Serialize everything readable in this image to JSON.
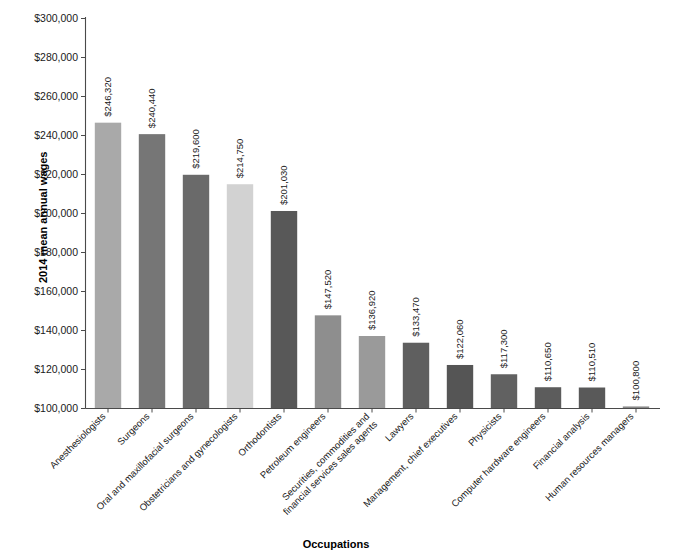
{
  "chart_data": {
    "type": "bar",
    "title": "",
    "xlabel": "Occupations",
    "ylabel": "2014 mean annual wages",
    "ylim": [
      100000,
      300000
    ],
    "ytick_step": 20000,
    "grid": false,
    "legend": "none",
    "value_label_prefix": "$",
    "ytick_labels": [
      "$300,000",
      "$280,000",
      "$260,000",
      "$240,000",
      "$220,000",
      "$200,000",
      "$180,000",
      "$160,000",
      "$140,000",
      "$120,000",
      "$100,000"
    ],
    "categories": [
      "Anesthesiologists",
      "Surgeons",
      "Oral and maxillofacial surgeons",
      "Obstetricians and gynecologists",
      "Orthodontists",
      "Petroleum engineers",
      "Securities, commodities and financial services sales agents",
      "Lawyers",
      "Management, chief executives",
      "Physicists",
      "Computer hardware engineers",
      "Financial analysis",
      "Human resources managers"
    ],
    "category_lines": [
      [
        "Anesthesiologists"
      ],
      [
        "Surgeons"
      ],
      [
        "Oral and maxillofacial surgeons"
      ],
      [
        "Obstetricians and gynecologists"
      ],
      [
        "Orthodontists"
      ],
      [
        "Petroleum engineers"
      ],
      [
        "Securities, commodities and",
        "financial services sales agents"
      ],
      [
        "Lawyers"
      ],
      [
        "Management, chief executives"
      ],
      [
        "Physicists"
      ],
      [
        "Computer hardware engineers"
      ],
      [
        "Financial analysis"
      ],
      [
        "Human resources managers"
      ]
    ],
    "values": [
      246320,
      240440,
      219600,
      214750,
      201030,
      147520,
      136920,
      133470,
      122060,
      117300,
      110650,
      110510,
      100800
    ],
    "value_labels": [
      "$246,320",
      "$240,440",
      "$219,600",
      "$214,750",
      "$201,030",
      "$147,520",
      "$136,920",
      "$133,470",
      "$122,060",
      "$117,300",
      "$110,650",
      "$110,510",
      "$100,800"
    ],
    "bar_colors": [
      "#a9a9a9",
      "#767676",
      "#6a6a6a",
      "#d2d2d2",
      "#585858",
      "#8e8e8e",
      "#9a9a9a",
      "#5f5f5f",
      "#555555",
      "#616161",
      "#5c5c5c",
      "#595959",
      "#8a8a8a"
    ],
    "axis_color": "#4a4a4a"
  }
}
